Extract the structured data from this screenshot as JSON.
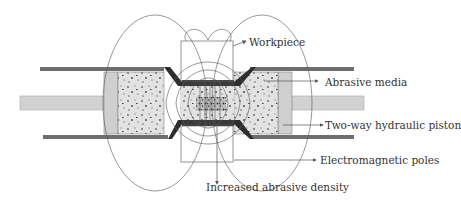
{
  "diagram": {
    "type": "schematic",
    "labels": [
      {
        "id": "workpiece",
        "text": "Workpiece"
      },
      {
        "id": "abrasive_media",
        "text": "Abrasive media"
      },
      {
        "id": "hydraulic_piston",
        "text": "Two-way hydraulic piston"
      },
      {
        "id": "em_poles",
        "text": "Electromagnetic poles"
      },
      {
        "id": "abrasive_density",
        "text": "Increased abrasive density"
      }
    ],
    "colors": {
      "cylinder_wall": "#6e6e6e",
      "piston": "#cfcfcf",
      "media": "#dcdcdc",
      "workpiece": "#2e2e2e",
      "field_line": "#555555",
      "label_text": "#333333"
    }
  }
}
